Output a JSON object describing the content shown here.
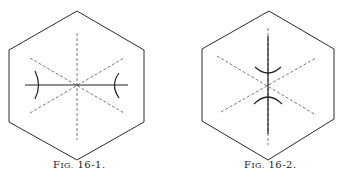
{
  "figures": [
    {
      "caption_prefix": "F",
      "caption_smallcaps": "IG.",
      "caption_number": "16-1.",
      "description": "Hexagon with three dashed axes through center; solid horizontal axis with two arcs concave toward center"
    },
    {
      "caption_prefix": "F",
      "caption_smallcaps": "IG.",
      "caption_number": "16-2.",
      "description": "Hexagon with three dashed axes through center; solid vertical axis with two arcs above and below center"
    }
  ],
  "colors": {
    "line": "#2a2a2a",
    "dash": "#555555",
    "background": "#ffffff"
  }
}
